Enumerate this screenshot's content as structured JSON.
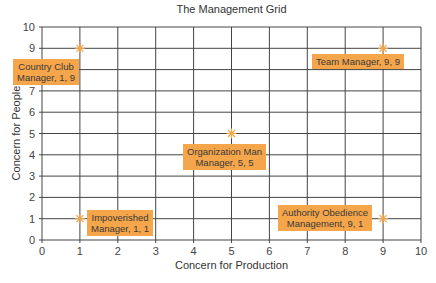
{
  "chart_data": {
    "type": "scatter",
    "title": "The Management Grid",
    "xlabel": "Concern for Production",
    "ylabel": "Concern for People",
    "xlim": [
      0,
      10
    ],
    "ylim": [
      0,
      10
    ],
    "x_ticks": [
      "0",
      "1",
      "2",
      "3",
      "4",
      "5",
      "6",
      "7",
      "8",
      "9",
      "10"
    ],
    "y_ticks": [
      "0",
      "1",
      "2",
      "3",
      "4",
      "5",
      "6",
      "7",
      "8",
      "9",
      "10"
    ],
    "grid": true,
    "legend": null,
    "points": [
      {
        "x": 1,
        "y": 9,
        "label_line1": "Country Club",
        "label_line2": "Manager, 1, 9"
      },
      {
        "x": 9,
        "y": 9,
        "label_line1": "Team Manager, 9, 9",
        "label_line2": ""
      },
      {
        "x": 5,
        "y": 5,
        "label_line1": "Organization Man",
        "label_line2": "Manager, 5, 5"
      },
      {
        "x": 1,
        "y": 1,
        "label_line1": "Impoverished",
        "label_line2": "Manager, 1, 1"
      },
      {
        "x": 9,
        "y": 1,
        "label_line1": "Authority Obedience",
        "label_line2": "Management, 9, 1"
      }
    ],
    "colors": {
      "marker": "#f5a54a",
      "label_bg": "#f5a54a",
      "grid": "#444444"
    }
  },
  "caption_cut": "Source of the managerial grid"
}
